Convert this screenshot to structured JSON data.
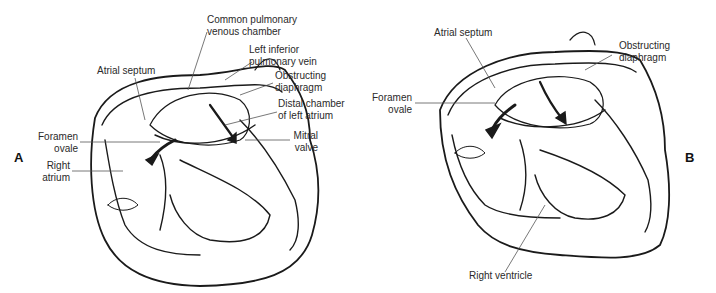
{
  "figure": {
    "panels": [
      {
        "id": "A",
        "label": "A",
        "annotations": {
          "common_pulmonary_venous_chamber": [
            "Common pulmonary",
            "venous chamber"
          ],
          "left_inferior_pulmonary_vein": [
            "Left inferior",
            "pulmonary vein"
          ],
          "atrial_septum": [
            "Atrial septum"
          ],
          "obstructing_diaphragm": [
            "Obstructing",
            "diaphragm"
          ],
          "distal_chamber_left_atrium": [
            "Distal chamber",
            "of left atrium"
          ],
          "foramen_ovale": [
            "Foramen",
            "ovale"
          ],
          "mitral_valve": [
            "Mitral",
            "valve"
          ],
          "right_atrium": [
            "Right",
            "atrium"
          ]
        }
      },
      {
        "id": "B",
        "label": "B",
        "annotations": {
          "atrial_septum": [
            "Atrial septum"
          ],
          "obstructing_diaphragm": [
            "Obstructing",
            "diaphragm"
          ],
          "foramen_ovale": [
            "Foramen",
            "ovale"
          ],
          "right_ventricle": [
            "Right ventricle"
          ]
        }
      }
    ],
    "colors": {
      "ink": "#1a1a1a",
      "leader": "#555555",
      "text": "#2a2a2a"
    }
  }
}
